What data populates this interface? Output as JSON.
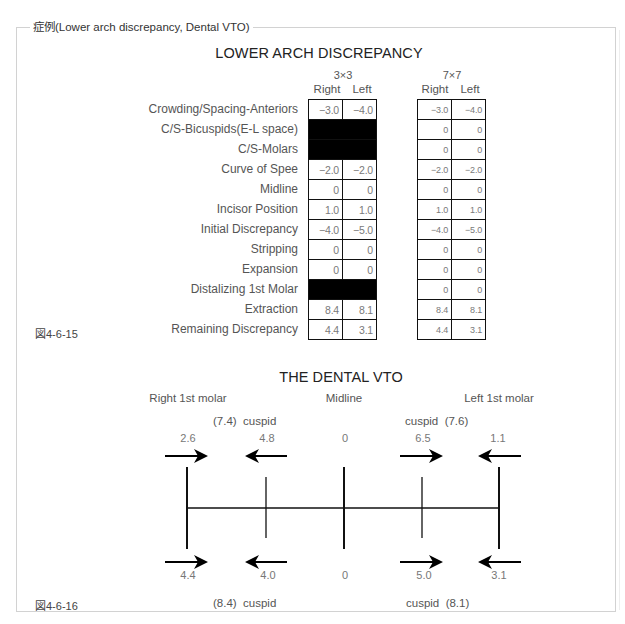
{
  "page": {
    "frame_legend": "症例(Lower arch discrepancy, Dental VTO)"
  },
  "arch_discrepancy": {
    "title": "LOWER ARCH DISCREPANCY",
    "figure_label": "図4-6-15",
    "groups": [
      {
        "label": "3×3",
        "columns": [
          "Right",
          "Left"
        ]
      },
      {
        "label": "7×7",
        "columns": [
          "Right",
          "Left"
        ]
      }
    ],
    "rows": [
      {
        "label": "Crowding/Spacing-Anteriors",
        "g3x3": [
          "−3.0",
          "−4.0"
        ],
        "g7x7": [
          "−3.0",
          "−4.0"
        ]
      },
      {
        "label": "C/S-Bicuspids(E-L space)",
        "g3x3": null,
        "g7x7": [
          "0",
          "0"
        ]
      },
      {
        "label": "C/S-Molars",
        "g3x3": null,
        "g7x7": [
          "0",
          "0"
        ]
      },
      {
        "label": "Curve of Spee",
        "g3x3": [
          "−2.0",
          "−2.0"
        ],
        "g7x7": [
          "−2.0",
          "−2.0"
        ]
      },
      {
        "label": "Midline",
        "g3x3": [
          "0",
          "0"
        ],
        "g7x7": [
          "0",
          "0"
        ]
      },
      {
        "label": "Incisor Position",
        "g3x3": [
          "1.0",
          "1.0"
        ],
        "g7x7": [
          "1.0",
          "1.0"
        ]
      },
      {
        "label": "Initial Discrepancy",
        "g3x3": [
          "−4.0",
          "−5.0"
        ],
        "g7x7": [
          "−4.0",
          "−5.0"
        ]
      },
      {
        "label": "Stripping",
        "g3x3": [
          "0",
          "0"
        ],
        "g7x7": [
          "0",
          "0"
        ]
      },
      {
        "label": "Expansion",
        "g3x3": [
          "0",
          "0"
        ],
        "g7x7": [
          "0",
          "0"
        ]
      },
      {
        "label": "Distalizing 1st Molar",
        "g3x3": null,
        "g7x7": [
          "0",
          "0"
        ]
      },
      {
        "label": "Extraction",
        "g3x3": [
          "8.4",
          "8.1"
        ],
        "g7x7": [
          "8.4",
          "8.1"
        ]
      },
      {
        "label": "Remaining Discrepancy",
        "g3x3": [
          "4.4",
          "3.1"
        ],
        "g7x7": [
          "4.4",
          "3.1"
        ]
      }
    ]
  },
  "dental_vto": {
    "title": "THE DENTAL VTO",
    "figure_label": "図4-6-16",
    "positions": {
      "right_molar": "Right 1st molar",
      "midline": "Midline",
      "left_molar": "Left 1st molar"
    },
    "upper": {
      "right_cuspid_label": "(7.4)  cuspid",
      "left_cuspid_label": "cuspid  (7.6)",
      "values": {
        "right_molar": "2.6",
        "right_cuspid": "4.8",
        "midline": "0",
        "left_cuspid": "6.5",
        "left_molar": "1.1"
      },
      "arrows": [
        "right",
        "left",
        "right",
        "left"
      ]
    },
    "lower": {
      "right_cuspid_label": "(8.4)  cuspid",
      "left_cuspid_label": "cuspid  (8.1)",
      "values": {
        "right_molar": "4.4",
        "right_cuspid": "4.0",
        "midline": "0",
        "left_cuspid": "5.0",
        "left_molar": "3.1"
      },
      "arrows": [
        "right",
        "left",
        "right",
        "left"
      ]
    }
  }
}
